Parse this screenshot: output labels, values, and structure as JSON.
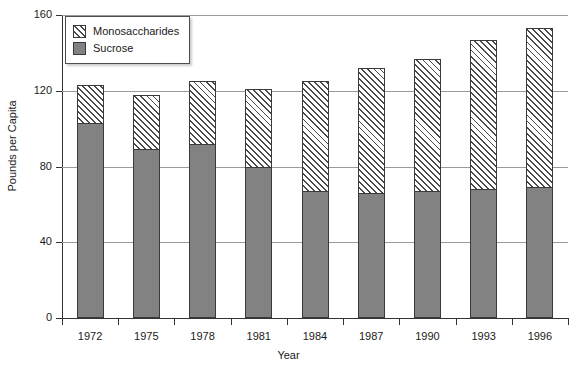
{
  "chart_data": {
    "type": "bar",
    "subtype": "stacked-bar",
    "title": "",
    "xlabel": "Year",
    "ylabel": "Pounds per Capita",
    "categories": [
      "1972",
      "1975",
      "1978",
      "1981",
      "1984",
      "1987",
      "1990",
      "1993",
      "1996"
    ],
    "series": [
      {
        "name": "Sucrose",
        "color": "#828282",
        "pattern": "solid-gray",
        "values": [
          103,
          89,
          92,
          80,
          67,
          66,
          67,
          68,
          69
        ]
      },
      {
        "name": "Monosaccharides",
        "color": "#ffffff",
        "pattern": "diagonal-hatch",
        "values": [
          20,
          29,
          33,
          41,
          58,
          66,
          70,
          79,
          84
        ]
      }
    ],
    "totals": [
      123,
      118,
      125,
      121,
      125,
      132,
      137,
      147,
      153
    ],
    "ylim": [
      0,
      160
    ],
    "yticks": [
      0,
      40,
      80,
      120,
      160
    ],
    "ytick_labels": [
      "0",
      "40",
      "80",
      "120",
      "160"
    ],
    "grid": true,
    "grid_axis": "y",
    "legend_position": "top-left",
    "legend_entries": [
      "Monosaccharides",
      "Sucrose"
    ]
  },
  "legend": {
    "items": [
      {
        "label": "Monosaccharides",
        "swatch": "hatch"
      },
      {
        "label": "Sucrose",
        "swatch": "solid"
      }
    ]
  }
}
